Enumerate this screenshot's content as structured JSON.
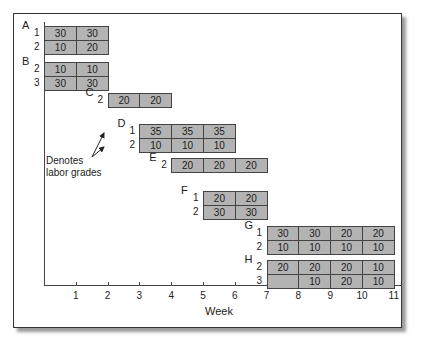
{
  "chart_data": {
    "type": "gantt",
    "title": "",
    "xlabel": "Week",
    "ticks": [
      "1",
      "2",
      "3",
      "4",
      "5",
      "6",
      "7",
      "8",
      "9",
      "10",
      "11"
    ],
    "annotation": [
      "Denotes",
      "labor grades"
    ],
    "activities": [
      {
        "name": "A",
        "start_week": 0,
        "rows": [
          {
            "grade": "1",
            "values": [
              "30",
              "30"
            ]
          },
          {
            "grade": "2",
            "values": [
              "10",
              "20"
            ]
          }
        ]
      },
      {
        "name": "B",
        "start_week": 0,
        "rows": [
          {
            "grade": "2",
            "values": [
              "10",
              "10"
            ]
          },
          {
            "grade": "3",
            "values": [
              "30",
              "30"
            ]
          }
        ]
      },
      {
        "name": "C",
        "start_week": 2,
        "rows": [
          {
            "grade": "2",
            "values": [
              "20",
              "20"
            ]
          }
        ]
      },
      {
        "name": "D",
        "start_week": 3,
        "rows": [
          {
            "grade": "1",
            "values": [
              "35",
              "35",
              "35"
            ]
          },
          {
            "grade": "2",
            "values": [
              "10",
              "10",
              "10"
            ]
          }
        ]
      },
      {
        "name": "E",
        "start_week": 4,
        "rows": [
          {
            "grade": "2",
            "values": [
              "20",
              "20",
              "20"
            ]
          }
        ]
      },
      {
        "name": "F",
        "start_week": 5,
        "rows": [
          {
            "grade": "1",
            "values": [
              "20",
              "20"
            ]
          },
          {
            "grade": "2",
            "values": [
              "30",
              "30"
            ]
          }
        ]
      },
      {
        "name": "G",
        "start_week": 7,
        "rows": [
          {
            "grade": "1",
            "values": [
              "30",
              "30",
              "20",
              "20"
            ]
          },
          {
            "grade": "2",
            "values": [
              "10",
              "10",
              "10",
              "10"
            ]
          }
        ]
      },
      {
        "name": "H",
        "start_week": 7,
        "rows": [
          {
            "grade": "2",
            "values": [
              "20",
              "20",
              "20",
              "10"
            ]
          },
          {
            "grade": "3",
            "values": [
              "",
              "10",
              "20",
              "10"
            ]
          }
        ]
      }
    ]
  }
}
